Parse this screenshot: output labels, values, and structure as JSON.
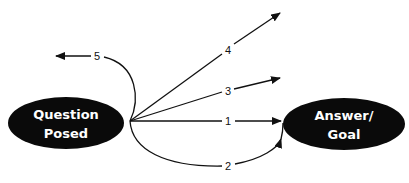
{
  "diagram": {
    "nodes": [
      {
        "id": "question",
        "line1": "Question",
        "line2": "Posed"
      },
      {
        "id": "answer",
        "line1": "Answer/",
        "line2": "Goal"
      }
    ],
    "paths": [
      {
        "label": "1",
        "description": "straight path to answer"
      },
      {
        "label": "2",
        "description": "curved lower path to answer"
      },
      {
        "label": "3",
        "description": "path diverging slightly upward"
      },
      {
        "label": "4",
        "description": "path diverging steeply upward"
      },
      {
        "label": "5",
        "description": "path looping back leftward"
      }
    ],
    "colors": {
      "node_fill": "#0a0a0a",
      "node_text": "#ffffff",
      "line": "#111111",
      "background": "#ffffff"
    }
  }
}
